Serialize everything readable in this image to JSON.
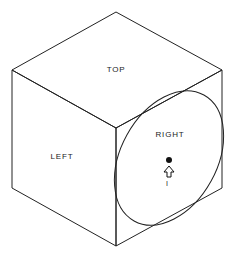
{
  "diagram": {
    "type": "isometric-cube",
    "faces": {
      "top": {
        "label": "TOP"
      },
      "left": {
        "label": "LEFT"
      },
      "right": {
        "label": "RIGHT"
      }
    },
    "marker": {
      "label": "I"
    },
    "colors": {
      "stroke": "#222222",
      "background": "#ffffff"
    }
  }
}
